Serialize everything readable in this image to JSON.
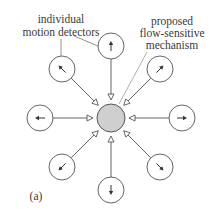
{
  "labels": {
    "detectors_line1": "individual",
    "detectors_line2": "motion detectors",
    "mechanism_line1": "proposed",
    "mechanism_line2": "flow-sensitive",
    "mechanism_line3": "mechanism",
    "panel": "(a)"
  },
  "colors": {
    "stroke": "#555555",
    "center_fill": "#cfcfcf",
    "background": "#ffffff",
    "leader": "#888888"
  },
  "center": {
    "x": 111,
    "y": 118,
    "radius": 14,
    "triangle_radius": 21
  },
  "detectors": [
    {
      "name": "up",
      "x": 111,
      "y": 46,
      "angle": -90
    },
    {
      "name": "up-right",
      "x": 160,
      "y": 69,
      "angle": -45
    },
    {
      "name": "right",
      "x": 182,
      "y": 118,
      "angle": 0
    },
    {
      "name": "down-right",
      "x": 160,
      "y": 167,
      "angle": 45
    },
    {
      "name": "down",
      "x": 111,
      "y": 190,
      "angle": 90
    },
    {
      "name": "down-left",
      "x": 62,
      "y": 167,
      "angle": 135
    },
    {
      "name": "left",
      "x": 40,
      "y": 118,
      "angle": 180
    },
    {
      "name": "up-left",
      "x": 62,
      "y": 69,
      "angle": -135
    }
  ],
  "detector_radius": 13
}
